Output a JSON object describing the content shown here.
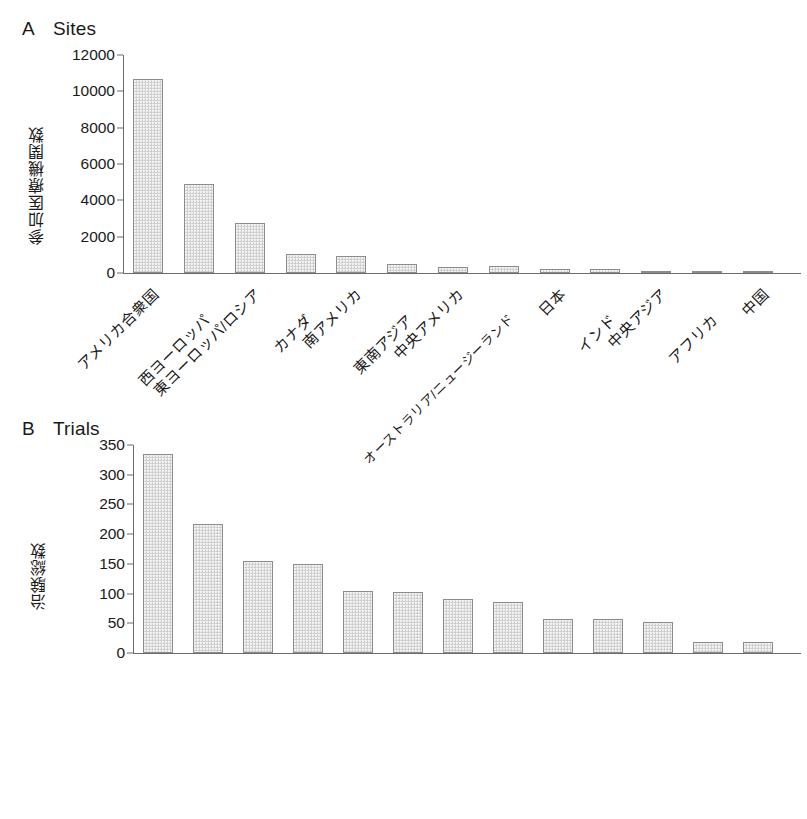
{
  "figure": {
    "background": "#ffffff",
    "bar_fill": "#dcdcdc",
    "bar_border": "#8c8c8c",
    "axis_color": "#6b6b6b"
  },
  "panels": [
    {
      "letter": "A",
      "title": "Sites"
    },
    {
      "letter": "B",
      "title": "Trials"
    }
  ],
  "chart_data": [
    {
      "type": "bar",
      "title": "A  Sites",
      "xlabel": "",
      "ylabel": "参加医療機関数",
      "ylim": [
        0,
        12000
      ],
      "yticks": [
        0,
        2000,
        4000,
        6000,
        8000,
        10000,
        12000
      ],
      "ytick_labels": [
        "0",
        "2000",
        "4000",
        "6000",
        "8000",
        "10000",
        "12000"
      ],
      "grid": false,
      "legend": "none",
      "categories": [
        "アメリカ合衆国",
        "西ヨーロッパ",
        "東ヨーロッパ/ロシア",
        "カナダ",
        "南アメリカ",
        "東南アジア",
        "中央アメリカ",
        "オーストラリア/ニュージーランド",
        "日本",
        "インド",
        "中央アジア",
        "アフリカ",
        "中国"
      ],
      "values": [
        10670,
        4880,
        2750,
        1030,
        960,
        520,
        330,
        380,
        230,
        210,
        90,
        100,
        60
      ]
    },
    {
      "type": "bar",
      "title": "B  Trials",
      "xlabel": "",
      "ylabel": "治験総数",
      "ylim": [
        0,
        350
      ],
      "yticks": [
        0,
        50,
        100,
        150,
        200,
        250,
        300,
        350
      ],
      "ytick_labels": [
        "0",
        "50",
        "100",
        "150",
        "200",
        "250",
        "300",
        "350"
      ],
      "grid": false,
      "legend": "none",
      "categories": [
        "アメリカ合衆国",
        "西ヨーロッパ",
        "東ヨーロッパ/ロシア",
        "カナダ",
        "南アメリカ",
        "中央アメリカ",
        "東南アジア",
        "オーストラリア/ニュージーランド",
        "インド",
        "中央アジア",
        "アフリカ",
        "中国",
        "日本"
      ],
      "values": [
        335,
        217,
        155,
        150,
        104,
        103,
        91,
        86,
        58,
        57,
        52,
        19,
        18
      ]
    }
  ]
}
